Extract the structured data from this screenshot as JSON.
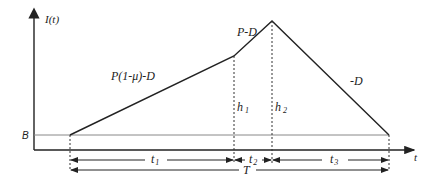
{
  "diagram": {
    "y_axis_label": "I(t)",
    "x_axis_label": "t",
    "baseline_label": "B",
    "segments": [
      {
        "id": "phase1",
        "slope_label": "P(1-μ)-D"
      },
      {
        "id": "phase2",
        "slope_label": "P-D"
      },
      {
        "id": "phase3",
        "slope_label": "-D"
      }
    ],
    "heights": {
      "h1": "h",
      "h1_sub": "1",
      "h2": "h",
      "h2_sub": "2"
    },
    "intervals": {
      "t1": "t",
      "t1_sub": "1",
      "t2": "t",
      "t2_sub": "2",
      "t3": "t",
      "t3_sub": "3",
      "total": "T"
    },
    "colors": {
      "line": "#222222",
      "baseline": "#888888",
      "dashed": "#333333"
    }
  }
}
